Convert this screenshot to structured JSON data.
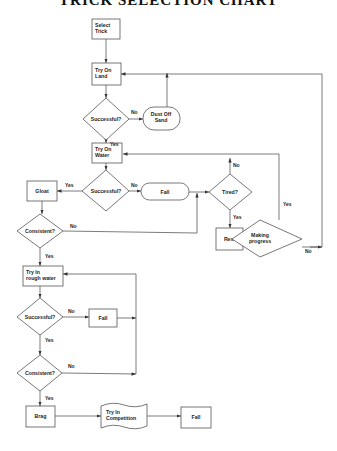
{
  "title": "TRICK SELECTION CHART",
  "nodes": {
    "select_trick": [
      "Select",
      "Trick"
    ],
    "try_on_land": [
      "Try On",
      "Land"
    ],
    "successful_1": "Successful?",
    "dust_off_sand": [
      "Dust Off",
      "Sand"
    ],
    "try_on_water": [
      "Try On",
      "Water"
    ],
    "successful_2": "Successful?",
    "fail_1": "Fall",
    "gloat": "Gloat",
    "consistent_1": "Consistent?",
    "tired": "Tired?",
    "rest": "Rest",
    "making_progress": [
      "Making",
      "progress"
    ],
    "try_rough_water": [
      "Try In",
      "rough water"
    ],
    "successful_3": "Successful?",
    "fail_2": "Fall",
    "consistent_2": "Consistent?",
    "brag": "Brag",
    "try_competition": [
      "Try In",
      "Competition"
    ],
    "fail_3": "Fall"
  },
  "edge_labels": {
    "yes": "Yes",
    "no": "No"
  }
}
